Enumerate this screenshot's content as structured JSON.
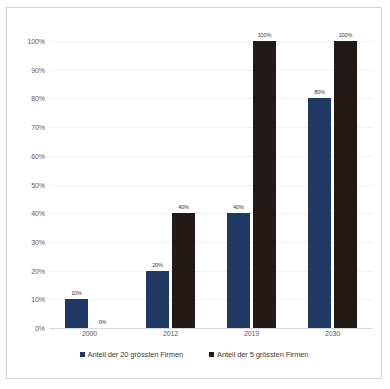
{
  "chart_data": {
    "type": "bar",
    "title": "",
    "subtitle": "",
    "xlabel": "",
    "ylabel": "",
    "categories": [
      "2000",
      "2012",
      "2019",
      "2030"
    ],
    "series": [
      {
        "name": "Anteil der 20 grössten Firmen",
        "color": "#1f3864",
        "values": [
          10,
          20,
          40,
          80
        ],
        "labels": [
          "10%",
          "20%",
          "40%",
          "80%"
        ]
      },
      {
        "name": "Anteil der 5 grössten Firmen",
        "color": "#231a17",
        "values": [
          0,
          40,
          100,
          100
        ],
        "labels": [
          "0%",
          "40%",
          "100%",
          "100%"
        ]
      }
    ],
    "ylim": [
      0,
      100
    ],
    "ytick_labels": [
      "100%",
      "90%",
      "80%",
      "70%",
      "60%",
      "50%",
      "40%",
      "30%",
      "20%",
      "10%",
      "0%"
    ],
    "ytick_values": [
      100,
      90,
      80,
      70,
      60,
      50,
      40,
      30,
      20,
      10,
      0
    ],
    "grid": true,
    "legend_position": "bottom"
  },
  "legend": {
    "entries": [
      {
        "label": "Anteil der 20 grössten Firmen"
      },
      {
        "label": "Anteil der 5 grössten Firmen"
      }
    ]
  }
}
